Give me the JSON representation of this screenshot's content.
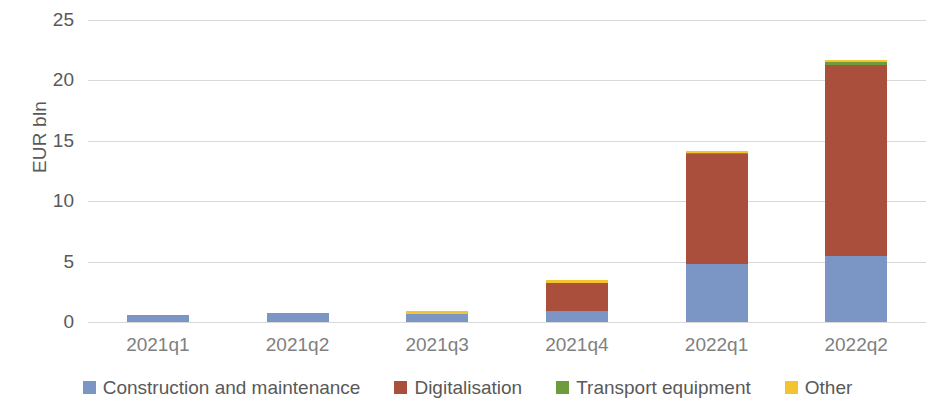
{
  "chart_data": {
    "type": "bar",
    "stacked": true,
    "title": "",
    "xlabel": "",
    "ylabel": "EUR bln",
    "ylim": [
      0,
      25
    ],
    "yticks": [
      0,
      5,
      10,
      15,
      20,
      25
    ],
    "grid": true,
    "legend_position": "bottom",
    "categories": [
      "2021q1",
      "2021q2",
      "2021q3",
      "2021q4",
      "2022q1",
      "2022q2"
    ],
    "series": [
      {
        "name": "Construction and maintenance",
        "color": "#7B96C4",
        "values": [
          0.6,
          0.75,
          0.7,
          0.9,
          4.8,
          5.5
        ]
      },
      {
        "name": "Digitalisation",
        "color": "#A94F3C",
        "values": [
          0.0,
          0.0,
          0.0,
          2.35,
          9.1,
          15.8
        ]
      },
      {
        "name": "Transport equipment",
        "color": "#6E9B3B",
        "values": [
          0.0,
          0.0,
          0.0,
          0.0,
          0.12,
          0.25
        ]
      },
      {
        "name": "Other",
        "color": "#F4C330",
        "values": [
          0.0,
          0.0,
          0.25,
          0.2,
          0.05,
          0.15
        ]
      }
    ],
    "totals": [
      0.6,
      0.75,
      0.95,
      3.45,
      14.07,
      21.7
    ]
  },
  "axis": {
    "y_title": "EUR bln",
    "y_ticks": [
      "25",
      "20",
      "15",
      "10",
      "5",
      "0"
    ],
    "x_ticks": [
      "2021q1",
      "2021q2",
      "2021q3",
      "2021q4",
      "2022q1",
      "2022q2"
    ]
  },
  "legend": {
    "items": [
      {
        "label": "Construction and maintenance",
        "color": "#7B96C4"
      },
      {
        "label": "Digitalisation",
        "color": "#A94F3C"
      },
      {
        "label": "Transport equipment",
        "color": "#6E9B3B"
      },
      {
        "label": "Other",
        "color": "#F4C330"
      }
    ]
  },
  "colors": {
    "gridline": "#d9d9d9",
    "text": "#595959",
    "background": "#ffffff"
  }
}
